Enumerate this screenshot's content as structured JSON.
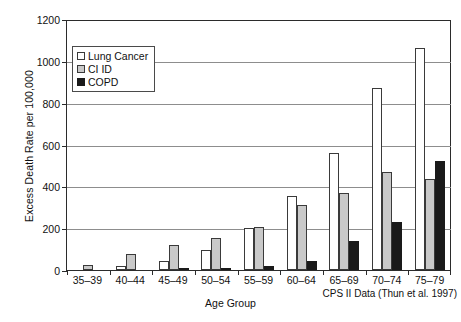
{
  "chart_data": {
    "type": "bar",
    "title": "",
    "xlabel": "Age Group",
    "ylabel": "Excess Death Rate per 100,000",
    "ylim": [
      0,
      1200
    ],
    "ytick_step": 200,
    "yticks": [
      0,
      200,
      400,
      600,
      800,
      1000,
      1200
    ],
    "grid": true,
    "legend_position": "upper-left-inside",
    "annotation": "CPS II Data (Thun et al. 1997)",
    "categories": [
      "35–39",
      "40–44",
      "45–49",
      "50–54",
      "55–59",
      "60–64",
      "65–69",
      "70–74",
      "75–79"
    ],
    "series": [
      {
        "name": "Lung Cancer",
        "color": "#ffffff",
        "values": [
          0,
          20,
          45,
          95,
          200,
          355,
          560,
          870,
          1060
        ]
      },
      {
        "name": "CI ID",
        "color": "#c9c9c9",
        "values": [
          25,
          75,
          120,
          155,
          205,
          310,
          370,
          470,
          435
        ]
      },
      {
        "name": "COPD",
        "color": "#1a1a1a",
        "values": [
          0,
          0,
          5,
          12,
          20,
          45,
          140,
          230,
          520
        ]
      }
    ]
  },
  "axes": {
    "ylabel": "Excess Death Rate per 100,000",
    "xlabel": "Age Group"
  },
  "legend": {
    "items": [
      {
        "label": "Lung Cancer",
        "swatch": "white-square-swatch"
      },
      {
        "label": "CI ID",
        "swatch": "gray-square-swatch"
      },
      {
        "label": "COPD",
        "swatch": "black-square-swatch"
      }
    ]
  },
  "footer": {
    "source": "CPS II Data (Thun et al. 1997)"
  }
}
